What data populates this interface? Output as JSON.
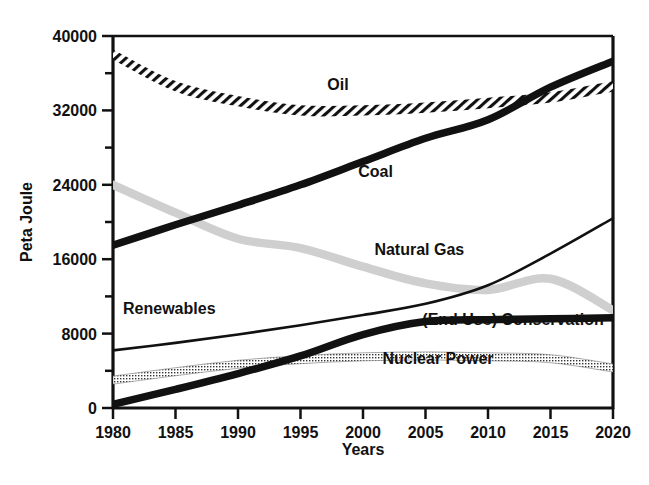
{
  "chart_data": {
    "type": "line",
    "title": "",
    "xlabel": "Years",
    "ylabel": "Peta Joule",
    "xlim": [
      1980,
      2020
    ],
    "ylim": [
      0,
      40000
    ],
    "grid": false,
    "legend_position": "inline-annotations",
    "x": [
      1980,
      1985,
      1990,
      1995,
      2000,
      2005,
      2010,
      2015,
      2020
    ],
    "xtick_labels": [
      "1980",
      "1985",
      "1990",
      "1995",
      "2000",
      "2005",
      "2010",
      "2015",
      "2020"
    ],
    "ytick_labels": [
      "0",
      "8000",
      "16000",
      "24000",
      "32000",
      "40000"
    ],
    "ytick_values": [
      0,
      8000,
      16000,
      24000,
      32000,
      40000
    ],
    "yminor_values": [
      4000,
      12000,
      20000,
      28000,
      36000
    ],
    "series": [
      {
        "name": "Oil",
        "label": "Oil",
        "style": "hatched-band",
        "color": "#111111",
        "values": [
          38000,
          34600,
          33000,
          32000,
          32000,
          32300,
          32800,
          33400,
          34600
        ]
      },
      {
        "name": "Coal",
        "label": "Coal",
        "style": "thick-solid",
        "color": "#111111",
        "values": [
          17500,
          19700,
          21800,
          24000,
          26500,
          29000,
          31000,
          34500,
          37300
        ]
      },
      {
        "name": "Natural Gas",
        "label": "Natural Gas",
        "style": "thick-light-gray",
        "color": "#cfcfcf",
        "values": [
          24000,
          21000,
          18200,
          17200,
          15200,
          13400,
          12700,
          13900,
          10500
        ]
      },
      {
        "name": "Renewables",
        "label": "Renewables",
        "style": "thin-solid",
        "color": "#111111",
        "values": [
          6200,
          7000,
          7900,
          8900,
          10000,
          11200,
          13200,
          16600,
          20400
        ]
      },
      {
        "name": "(End Use) Conservation",
        "label": "(End Use) Conservation",
        "style": "thick-solid",
        "color": "#111111",
        "values": [
          400,
          2000,
          3700,
          5600,
          7900,
          9300,
          9500,
          9600,
          9700
        ]
      },
      {
        "name": "Nuclear Power",
        "label": "Nuclear Power",
        "style": "stippled-band",
        "color": "#555555",
        "values": [
          3000,
          3900,
          4700,
          5200,
          5500,
          5600,
          5500,
          5300,
          4300
        ]
      }
    ],
    "annotations": [
      {
        "text": "Oil",
        "x": 1998,
        "y": 34200
      },
      {
        "text": "Coal",
        "x": 2001,
        "y": 24800
      },
      {
        "text": "Natural Gas",
        "x": 2004.5,
        "y": 16500
      },
      {
        "text": "Renewables",
        "x": 1984.5,
        "y": 10100
      },
      {
        "text": "(End Use) Conservation",
        "x": 2012,
        "y": 8900
      },
      {
        "text": "Nuclear Power",
        "x": 2006,
        "y": 4700
      }
    ]
  },
  "axes": {
    "x_title": "Years",
    "y_title": "Peta Joule"
  }
}
